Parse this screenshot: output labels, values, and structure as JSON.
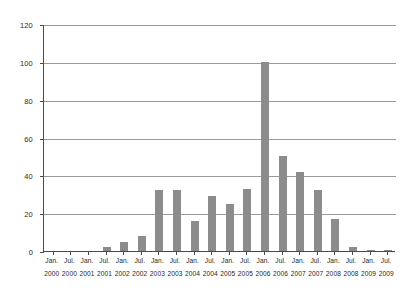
{
  "chart_data": {
    "type": "bar",
    "title": "",
    "subtitle": "",
    "xlabel": "",
    "ylabel": "",
    "ylim": [
      0,
      120
    ],
    "ytick_values": [
      0,
      20,
      40,
      60,
      80,
      100,
      120
    ],
    "ytick_labels": [
      "0",
      "20",
      "40",
      "60",
      "80",
      "100",
      "120"
    ],
    "grid": "horizontal",
    "legend": "none",
    "bar_color": "#8c8c8c",
    "axis_color": "#4a4a4a",
    "grid_color": "#9a9a9a",
    "background": "#ffffff",
    "categories": [
      "Jan. 2000",
      "Jul. 2000",
      "Jan. 2001",
      "Jul. 2001",
      "Jan. 2002",
      "Jul. 2002",
      "Jan. 2003",
      "Jul. 2003",
      "Jan. 2004",
      "Jul. 2004",
      "Jan. 2005",
      "Jul. 2005",
      "Jan. 2006",
      "Jul. 2006",
      "Jan. 2007",
      "Jul. 2007",
      "Jan. 2008",
      "Jul. 2008",
      "Jan. 2009",
      "Jul. 2009"
    ],
    "tick_months": [
      "Jan.",
      "Jul.",
      "Jan.",
      "Jul.",
      "Jan.",
      "Jul.",
      "Jan.",
      "Jul.",
      "Jan.",
      "Jul.",
      "Jan.",
      "Jul.",
      "Jan.",
      "Jul.",
      "Jan.",
      "Jul.",
      "Jan.",
      "Jul.",
      "Jan.",
      "Jul."
    ],
    "tick_years": [
      "2000",
      "2000",
      "2001",
      "2001",
      "2002",
      "2002",
      "2003",
      "2003",
      "2004",
      "2004",
      "2005",
      "2005",
      "2006",
      "2006",
      "2007",
      "2007",
      "2008",
      "2008",
      "2009",
      "2009"
    ],
    "values": [
      0,
      0,
      0,
      2,
      5,
      8,
      32,
      32,
      16,
      29,
      25,
      33,
      100,
      50,
      42,
      32,
      17,
      2,
      0.5,
      0.5
    ]
  }
}
